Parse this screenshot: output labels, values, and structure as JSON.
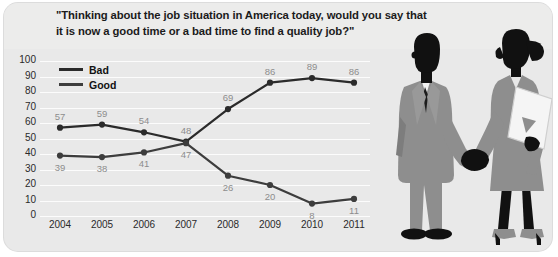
{
  "title": "\"Thinking about the job situation in America today, would you say that it is now a good time or a bad time to find a quality job?\"",
  "legend": {
    "items": [
      {
        "label": "Bad",
        "color": "#2b2b2b"
      },
      {
        "label": "Good",
        "color": "#3d3d3d"
      }
    ]
  },
  "colors": {
    "card_background": "#e9e9e9",
    "gridline": "#fcfcfc",
    "line_bad": "#2b2b2b",
    "line_good": "#3d3d3d",
    "point_label": "#8d8d8d",
    "axis_label": "#2a2a2a",
    "figure_dark": "#111111",
    "figure_gray": "#8e8e8e"
  },
  "illustration": {
    "description": "two-people-handshake-silhouette",
    "man": "businessman-silhouette",
    "woman": "businesswoman-with-folder-silhouette"
  },
  "chart_data": {
    "type": "line",
    "title": "\"Thinking about the job situation in America today, would you say that it is now a good time or a bad time to find a quality job?\"",
    "xlabel": "",
    "ylabel": "",
    "categories": [
      "2004",
      "2005",
      "2006",
      "2007",
      "2008",
      "2009",
      "2010",
      "2011"
    ],
    "ylim": [
      0,
      100
    ],
    "yticks": [
      0,
      10,
      20,
      30,
      40,
      50,
      60,
      70,
      80,
      90,
      100
    ],
    "grid": true,
    "legend_position": "top-left",
    "series": [
      {
        "name": "Bad",
        "values": [
          57,
          59,
          54,
          48,
          69,
          86,
          89,
          86
        ]
      },
      {
        "name": "Good",
        "values": [
          39,
          38,
          41,
          47,
          26,
          20,
          8,
          11
        ]
      }
    ]
  }
}
